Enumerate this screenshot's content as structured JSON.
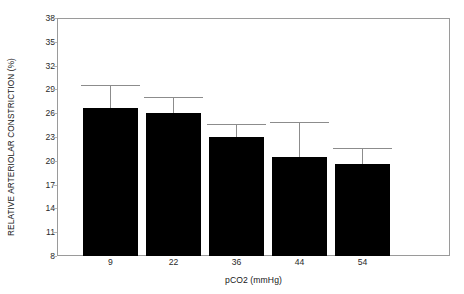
{
  "chart_data": {
    "type": "bar",
    "title": "",
    "xlabel": "pCO2 (mmHg)",
    "ylabel": "RELATIVE ARTERIOLAR CONSTRICTION (%)",
    "categories": [
      "9",
      "22",
      "36",
      "44",
      "54"
    ],
    "values": [
      26.7,
      26.0,
      23.0,
      20.5,
      19.6
    ],
    "errors_upper": [
      2.9,
      2.1,
      1.6,
      4.4,
      2.0
    ],
    "error_style": "upper-only-whisker-with-cap",
    "ylim": [
      8,
      38
    ],
    "yticks": [
      8,
      11,
      14,
      17,
      20,
      23,
      26,
      29,
      32,
      35,
      38
    ],
    "ytick_labels": [
      "8",
      "11",
      "14",
      "17",
      "20",
      "23",
      "26",
      "29",
      "32",
      "35",
      "38"
    ],
    "grid": false,
    "legend": null,
    "legend_position": "none",
    "bar_color": "#000000",
    "frame_color": "#9a9a9a",
    "errorbar_color": "#8c8c8c",
    "background": "#ffffff",
    "annotations": []
  }
}
